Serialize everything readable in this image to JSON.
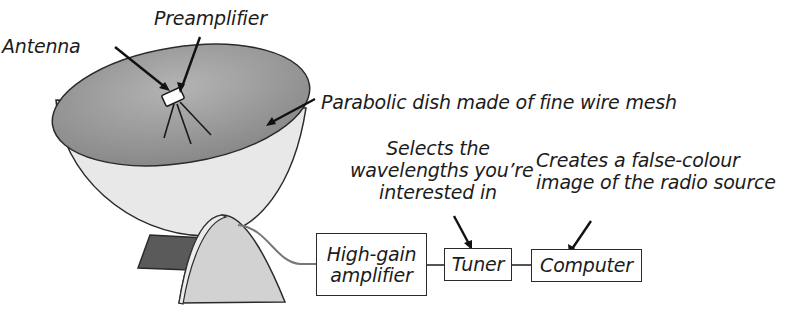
{
  "diagram": {
    "labels": {
      "antenna": "Antenna",
      "preamplifier": "Preamplifier",
      "dish": "Parabolic dish made of fine wire mesh",
      "tuner_note_line1": "Selects the",
      "tuner_note_line2": "wavelengths you’re",
      "tuner_note_line3": "interested in",
      "computer_note_line1": "Creates a false-colour",
      "computer_note_line2": "image of the radio source"
    },
    "boxes": {
      "amplifier_line1": "High-gain",
      "amplifier_line2": "amplifier",
      "tuner": "Tuner",
      "computer": "Computer"
    },
    "colors": {
      "dish_inner": "#8e8e8e",
      "dish_outer": "#e6e6e6",
      "stand_front": "#d2d2d2",
      "stand_back": "#5a5a5a",
      "outline": "#2a2a2a",
      "cable": "#777777"
    },
    "signal_chain": [
      "Antenna",
      "Preamplifier",
      "High-gain amplifier",
      "Tuner",
      "Computer"
    ]
  }
}
